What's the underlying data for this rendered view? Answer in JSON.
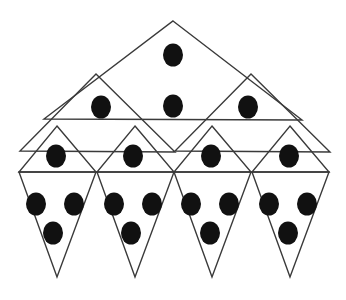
{
  "figure": {
    "width": 346,
    "height": 300,
    "background_color": "#ffffff",
    "stroke_color": "#3a3a3a",
    "stroke_width": 1.4,
    "dot_color": "#111111",
    "dot_radius_x": 10,
    "dot_radius_y": 11.5,
    "total_triangles": 11,
    "total_dots": 18,
    "levels": [
      {
        "name": "level-1-large-triangle",
        "count": 1,
        "dots": 2
      },
      {
        "name": "level-2-medium-triangles",
        "count": 2,
        "dots": 2
      },
      {
        "name": "level-3-small-triangles",
        "count": 4,
        "dots": 4
      },
      {
        "name": "level-4-inverted-triangles",
        "count": 4,
        "dots": 12
      }
    ]
  },
  "shapes": {
    "large_triangle": {
      "label": "large-triangle",
      "points": "173,21 302,120 44,119"
    },
    "medium_triangles": [
      {
        "label": "medium-triangle-left",
        "points": "96,74 175,152 20,151"
      },
      {
        "label": "medium-triangle-right",
        "points": "251,74 330,152 175,151"
      }
    ],
    "small_triangles": [
      {
        "label": "small-triangle-1",
        "points": "57,126 96,172 19,172"
      },
      {
        "label": "small-triangle-2",
        "points": "135,126 174,172 97,172"
      },
      {
        "label": "small-triangle-3",
        "points": "212,126 251,172 174,172"
      },
      {
        "label": "small-triangle-4",
        "points": "290,126 329,172 252,172"
      }
    ],
    "inverted_triangles": [
      {
        "label": "inverted-triangle-1",
        "points": "19,172 96,172 57,277"
      },
      {
        "label": "inverted-triangle-2",
        "points": "97,172 174,172 135,277"
      },
      {
        "label": "inverted-triangle-3",
        "points": "174,172 251,172 212,277"
      },
      {
        "label": "inverted-triangle-4",
        "points": "252,172 329,172 290,277"
      }
    ]
  },
  "dots": [
    {
      "label": "dot-apex",
      "cx": 173,
      "cy": 55
    },
    {
      "label": "dot-center-top",
      "cx": 173,
      "cy": 106
    },
    {
      "label": "dot-medium-left",
      "cx": 101,
      "cy": 107
    },
    {
      "label": "dot-medium-right",
      "cx": 248,
      "cy": 107
    },
    {
      "label": "dot-small-1",
      "cx": 56,
      "cy": 156
    },
    {
      "label": "dot-small-2",
      "cx": 133,
      "cy": 156
    },
    {
      "label": "dot-small-3",
      "cx": 211,
      "cy": 156
    },
    {
      "label": "dot-small-4",
      "cx": 289,
      "cy": 156
    },
    {
      "label": "dot-inv-1-left",
      "cx": 36,
      "cy": 204
    },
    {
      "label": "dot-inv-1-right",
      "cx": 74,
      "cy": 204
    },
    {
      "label": "dot-inv-1-bottom",
      "cx": 53,
      "cy": 233
    },
    {
      "label": "dot-inv-2-left",
      "cx": 114,
      "cy": 204
    },
    {
      "label": "dot-inv-2-right",
      "cx": 152,
      "cy": 204
    },
    {
      "label": "dot-inv-2-bottom",
      "cx": 131,
      "cy": 233
    },
    {
      "label": "dot-inv-3-left",
      "cx": 191,
      "cy": 204
    },
    {
      "label": "dot-inv-3-right",
      "cx": 229,
      "cy": 204
    },
    {
      "label": "dot-inv-3-bottom",
      "cx": 210,
      "cy": 233
    },
    {
      "label": "dot-inv-4-left",
      "cx": 269,
      "cy": 204
    },
    {
      "label": "dot-inv-4-right",
      "cx": 307,
      "cy": 204
    },
    {
      "label": "dot-inv-4-bottom",
      "cx": 288,
      "cy": 233
    }
  ]
}
